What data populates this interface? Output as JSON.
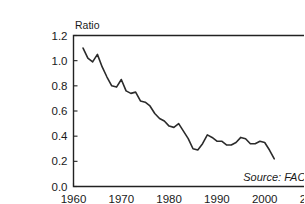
{
  "chart_data": {
    "type": "line",
    "title": "",
    "subtitle": "",
    "xlabel": "",
    "ylabel": "Ratio",
    "xlim": [
      1960,
      2010
    ],
    "ylim": [
      0.0,
      1.2
    ],
    "grid": false,
    "legend": "none",
    "source_note": "Source: FAO",
    "x_ticks": [
      "1960",
      "1970",
      "1980",
      "1990",
      "2000",
      "2010"
    ],
    "x_tick_values": [
      1960,
      1970,
      1980,
      1990,
      2000,
      2010
    ],
    "y_ticks": [
      "0.0",
      "0.2",
      "0.4",
      "0.6",
      "0.8",
      "1.0",
      "1.2"
    ],
    "y_tick_values": [
      0.0,
      0.2,
      0.4,
      0.6,
      0.8,
      1.0,
      1.2
    ],
    "series": [
      {
        "name": "Ratio",
        "color": "#2b2b2b",
        "x": [
          1962,
          1963,
          1964,
          1965,
          1966,
          1967,
          1968,
          1969,
          1970,
          1971,
          1972,
          1973,
          1974,
          1975,
          1976,
          1977,
          1978,
          1979,
          1980,
          1981,
          1982,
          1983,
          1984,
          1985,
          1986,
          1987,
          1988,
          1989,
          1990,
          1991,
          1992,
          1993,
          1994,
          1995,
          1996,
          1997,
          1998,
          1999,
          2000,
          2001,
          2002
        ],
        "values": [
          1.1,
          1.02,
          0.99,
          1.05,
          0.95,
          0.87,
          0.8,
          0.79,
          0.85,
          0.76,
          0.74,
          0.75,
          0.68,
          0.67,
          0.64,
          0.58,
          0.54,
          0.52,
          0.48,
          0.47,
          0.5,
          0.44,
          0.38,
          0.3,
          0.29,
          0.34,
          0.41,
          0.39,
          0.36,
          0.36,
          0.33,
          0.33,
          0.35,
          0.39,
          0.38,
          0.34,
          0.34,
          0.36,
          0.35,
          0.29,
          0.22
        ]
      }
    ]
  }
}
